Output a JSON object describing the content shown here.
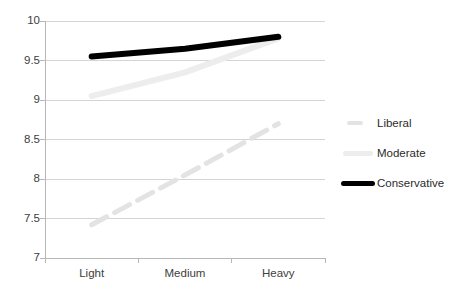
{
  "chart_data": {
    "type": "line",
    "title": "",
    "subtitle": "",
    "xlabel": "",
    "ylabel": "",
    "categories": [
      "Light",
      "Medium",
      "Heavy"
    ],
    "ylim": [
      7,
      10
    ],
    "yticks": [
      "7",
      "7.5",
      "8",
      "8.5",
      "9",
      "9.5",
      "10"
    ],
    "ytick_values": [
      7,
      7.5,
      8,
      8.5,
      9,
      9.5,
      10
    ],
    "grid": true,
    "grid_axis": "y",
    "legend_position": "right",
    "series": [
      {
        "name": "Liberal",
        "values": [
          7.42,
          8.05,
          8.7
        ],
        "color": "#e3e3e3",
        "style": "dashed",
        "width": 5
      },
      {
        "name": "Moderate",
        "values": [
          9.05,
          9.35,
          9.78
        ],
        "color": "#ededed",
        "style": "solid",
        "width": 6
      },
      {
        "name": "Conservative",
        "values": [
          9.55,
          9.65,
          9.8
        ],
        "color": "#000000",
        "style": "solid",
        "width": 6
      }
    ]
  },
  "axes": {
    "grid_color": "#d4d4d4",
    "axis_color": "#b7b7b7",
    "label_color": "#404040"
  },
  "legend": {
    "items": [
      {
        "label": "Liberal"
      },
      {
        "label": "Moderate"
      },
      {
        "label": "Conservative"
      }
    ]
  }
}
